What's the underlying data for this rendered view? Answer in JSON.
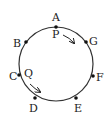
{
  "diagram": {
    "type": "circle-with-points",
    "circle": {
      "cx": 56,
      "cy": 64,
      "r": 37,
      "stroke": "#333"
    },
    "points": [
      {
        "label": "A",
        "x": 56,
        "y": 27,
        "lx": 52,
        "ly": 21
      },
      {
        "label": "G",
        "x": 86,
        "y": 42,
        "lx": 89,
        "ly": 45
      },
      {
        "label": "F",
        "x": 93,
        "y": 76,
        "lx": 96,
        "ly": 81
      },
      {
        "label": "E",
        "x": 76,
        "y": 98,
        "lx": 74,
        "ly": 112
      },
      {
        "label": "D",
        "x": 35,
        "y": 98,
        "lx": 29,
        "ly": 112
      },
      {
        "label": "C",
        "x": 19,
        "y": 75,
        "lx": 9,
        "ly": 80
      },
      {
        "label": "B",
        "x": 26,
        "y": 42,
        "lx": 13,
        "ly": 47
      }
    ],
    "movers": [
      {
        "label": "P",
        "lx": 52,
        "ly": 38,
        "arrow": "M63 35 Q70 38 74 43"
      },
      {
        "label": "Q",
        "lx": 24,
        "ly": 77,
        "arrow": "M30 84 Q35 89 40 92"
      }
    ]
  }
}
